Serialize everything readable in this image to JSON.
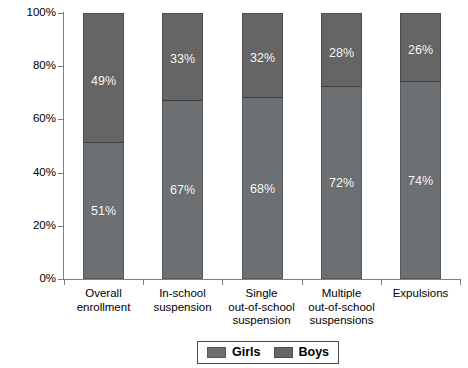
{
  "chart_data": {
    "type": "bar",
    "subtype": "stacked-bar-100-percent",
    "title": "",
    "xlabel": "",
    "ylabel": "",
    "ylim": [
      0,
      100
    ],
    "yticks": [
      "0%",
      "20%",
      "40%",
      "60%",
      "80%",
      "100%"
    ],
    "grid": false,
    "legend_position": "bottom-center",
    "categories": [
      "Overall enrollment",
      "In-school suspension",
      "Single out-of-school suspension",
      "Multiple out-of-school suspensions",
      "Expulsions"
    ],
    "series": [
      {
        "name": "Girls",
        "color": "#6c7073",
        "values": [
          51,
          67,
          68,
          72,
          74
        ],
        "labels": [
          "51%",
          "67%",
          "68%",
          "72%",
          "74%"
        ]
      },
      {
        "name": "Boys",
        "color": "#656565",
        "values": [
          49,
          33,
          32,
          28,
          26
        ],
        "labels": [
          "49%",
          "33%",
          "32%",
          "28%",
          "26%"
        ]
      }
    ]
  },
  "axis": {
    "y_labels": [
      "100%",
      "80%",
      "60%",
      "40%",
      "20%",
      "0%"
    ],
    "category_lines": [
      [
        "Overall",
        "enrollment"
      ],
      [
        "In-school",
        "suspension"
      ],
      [
        "Single",
        "out-of-school",
        "suspension"
      ],
      [
        "Multiple",
        "out-of-school",
        "suspensions"
      ],
      [
        "Expulsions"
      ]
    ]
  },
  "legend": {
    "items": [
      {
        "label": "Girls",
        "color": "#6c7073"
      },
      {
        "label": "Boys",
        "color": "#656565"
      }
    ]
  }
}
